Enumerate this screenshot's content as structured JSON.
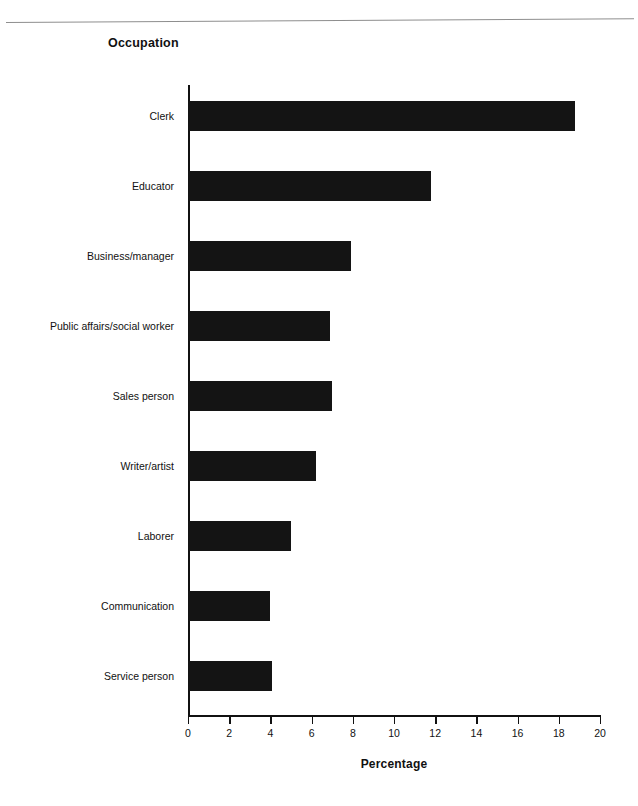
{
  "page": {
    "rule_color": "#8e8e8e",
    "background": "#ffffff"
  },
  "chart_data": {
    "type": "bar",
    "orientation": "horizontal",
    "title": "Occupation",
    "xlabel": "Percentage",
    "ylabel": "",
    "xlim": [
      0,
      20
    ],
    "xticks": [
      0,
      2,
      4,
      6,
      8,
      10,
      12,
      14,
      16,
      18,
      20
    ],
    "xtick_labels": [
      "0",
      "2",
      "4",
      "6",
      "8",
      "10",
      "12",
      "14",
      "16",
      "18",
      "20"
    ],
    "grid": false,
    "legend": false,
    "bar_color": "#141414",
    "categories": [
      "Clerk",
      "Educator",
      "Business/manager",
      "Public affairs/social worker",
      "Sales person",
      "Writer/artist",
      "Laborer",
      "Communication",
      "Service person"
    ],
    "values": [
      18.8,
      11.8,
      7.9,
      6.9,
      7.0,
      6.2,
      5.0,
      4.0,
      4.1
    ]
  }
}
